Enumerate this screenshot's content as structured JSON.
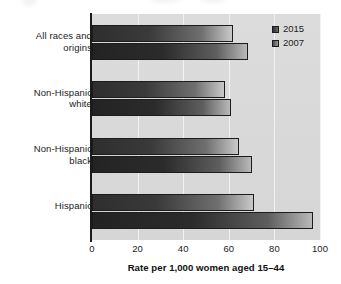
{
  "chart_data": {
    "type": "bar",
    "orientation": "horizontal",
    "title": "",
    "categories": [
      "All races and\norigins",
      "Non-Hispanic\nwhite",
      "Non-Hispanic\nblack",
      "Hispanic"
    ],
    "series": [
      {
        "name": "2015",
        "values": [
          62,
          58.5,
          64.5,
          71
        ]
      },
      {
        "name": "2007",
        "values": [
          68.5,
          61,
          70,
          97
        ]
      }
    ],
    "xlabel": "Rate per 1,000 women aged 15–44",
    "ylabel": "",
    "xlim": [
      0,
      100
    ],
    "xticks": [
      "0",
      "20",
      "40",
      "60",
      "80",
      "100"
    ],
    "grid": "vertical",
    "legend_position": "top-right"
  },
  "legend": {
    "items": [
      {
        "label": "2015",
        "swatch": "legend-swatch-2015"
      },
      {
        "label": "2007",
        "swatch": "legend-swatch-2007"
      }
    ]
  },
  "colors": {
    "plot_background": "#d9d9d9",
    "gridline": "#f2f2f2",
    "axis": "#1b1b1b",
    "bar_2015_dark": "#2e2e2e",
    "bar_2015_light": "#c9c9c9",
    "bar_2007_dark": "#232323",
    "bar_2007_light": "#b9b9b9",
    "text": "#1c1c1c"
  }
}
